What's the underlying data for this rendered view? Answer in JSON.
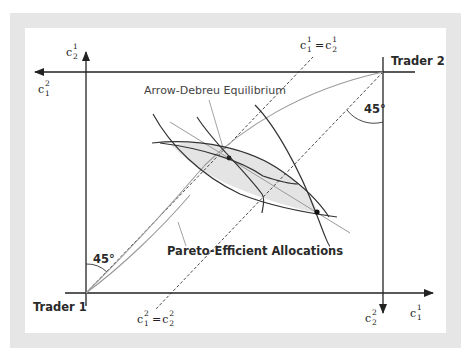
{
  "diagram": {
    "type": "edgeworth-box",
    "labels": {
      "trader1": "Trader 1",
      "trader2": "Trader 2",
      "equilibrium": "Arrow-Debreu Equilibrium",
      "pareto": "Pareto-Efficient Allocations",
      "angle_bottom_left": "45°",
      "angle_top_right": "45°"
    },
    "axes": {
      "trader1_x": {
        "base": "c",
        "sup": "1",
        "sub": "1"
      },
      "trader1_y": {
        "base": "c",
        "sup": "1",
        "sub": "2"
      },
      "trader2_x": {
        "base": "c",
        "sup": "2",
        "sub": "1"
      },
      "trader2_y": {
        "base": "c",
        "sup": "2",
        "sub": "2"
      }
    },
    "certainty_lines": {
      "trader1": {
        "lhs_base": "c",
        "lhs_sup": "1",
        "lhs_sub": "1",
        "eq": "=",
        "rhs_base": "c",
        "rhs_sup": "1",
        "rhs_sub": "2"
      },
      "trader2": {
        "lhs_base": "c",
        "lhs_sup": "2",
        "lhs_sub": "1",
        "eq": "=",
        "rhs_base": "c",
        "rhs_sup": "2",
        "rhs_sub": "2"
      }
    },
    "colors": {
      "frame": "#e6e6e6",
      "axis": "#222222",
      "indifference": "#333333",
      "contract_curve": "#9a9a9a",
      "lens_fill": "#e4e4e4"
    }
  }
}
